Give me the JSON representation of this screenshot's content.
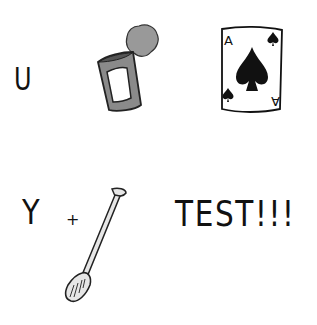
{
  "puzzle": {
    "type": "rebus",
    "row1": {
      "letter": "U",
      "can_icon": "open-tin-can-icon",
      "card_icon": "ace-of-spades-card-icon",
      "card_rank_top": "A",
      "card_rank_bottom": "A"
    },
    "row2": {
      "letter": "Y",
      "plus": "+",
      "oar_icon": "paddle-oar-icon",
      "word": "TEST!!!"
    }
  },
  "colors": {
    "ink": "#111111",
    "can_gray": "#8a8a8a",
    "lid_gray": "#999999",
    "paddle_light": "#e6e6e6"
  }
}
